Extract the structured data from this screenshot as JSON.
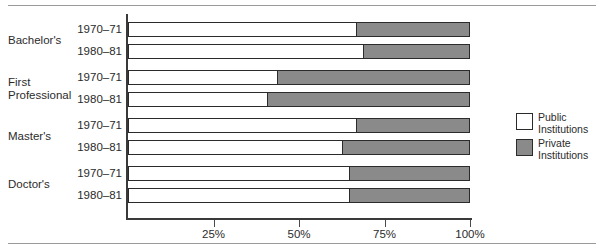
{
  "chart_data": {
    "type": "bar",
    "orientation": "horizontal",
    "stacked": true,
    "stacked_mode": "percent",
    "title": "",
    "subtitle": "",
    "xlabel": "",
    "ylabel": "",
    "xlim": [
      0,
      100
    ],
    "grid": false,
    "legend_position": "right",
    "axis": {
      "tick_labels": [
        "25%",
        "50%",
        "75%",
        "100%"
      ],
      "tick_values": [
        25,
        50,
        75,
        100
      ]
    },
    "groups": [
      {
        "label": "Bachelor's",
        "rows": [
          {
            "period": "1970–71",
            "public": 67,
            "private": 33
          },
          {
            "period": "1980–81",
            "public": 69,
            "private": 31
          }
        ]
      },
      {
        "label": "First\nProfessional",
        "rows": [
          {
            "period": "1970–71",
            "public": 44,
            "private": 56
          },
          {
            "period": "1980–81",
            "public": 41,
            "private": 59
          }
        ]
      },
      {
        "label": "Master's",
        "rows": [
          {
            "period": "1970–71",
            "public": 67,
            "private": 33
          },
          {
            "period": "1980–81",
            "public": 63,
            "private": 37
          }
        ]
      },
      {
        "label": "Doctor's",
        "rows": [
          {
            "period": "1970–71",
            "public": 65,
            "private": 35
          },
          {
            "period": "1980–81",
            "public": 65,
            "private": 35
          }
        ]
      }
    ],
    "series": [
      {
        "name": "Public Institutions",
        "color": "#ffffff",
        "values": [
          67,
          69,
          44,
          41,
          67,
          63,
          65,
          65
        ]
      },
      {
        "name": "Private Institutions",
        "color": "#8a8a8a",
        "values": [
          33,
          31,
          56,
          59,
          33,
          37,
          35,
          35
        ]
      }
    ],
    "categories": [
      "Bachelor's 1970–71",
      "Bachelor's 1980–81",
      "First Professional 1970–71",
      "First Professional 1980–81",
      "Master's 1970–71",
      "Master's 1980–81",
      "Doctor's 1970–71",
      "Doctor's 1980–81"
    ]
  },
  "legend": {
    "items": [
      {
        "label": "Public\nInstitutions",
        "swatch": "public"
      },
      {
        "label": "Private\nInstitutions",
        "swatch": "private"
      }
    ]
  }
}
